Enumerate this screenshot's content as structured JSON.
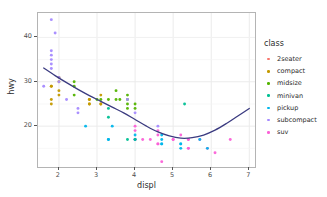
{
  "chart_data": {
    "type": "scatter",
    "title": "",
    "xlabel": "displ",
    "ylabel": "hwy",
    "xlim": [
      1.45,
      7.15
    ],
    "ylim": [
      10.8,
      45.5
    ],
    "xticks": [
      2,
      3,
      4,
      5,
      6,
      7
    ],
    "yticks": [
      20,
      30,
      40
    ],
    "xtick_labels": [
      "2",
      "3",
      "4",
      "5",
      "6",
      "7"
    ],
    "ytick_labels": [
      "20",
      "30",
      "40"
    ],
    "grid": true,
    "legend_position": "right",
    "legend_title": "class",
    "series": [
      {
        "name": "2seater",
        "color": "#F8766D",
        "points": [
          [
            5.7,
            26
          ],
          [
            5.7,
            23
          ],
          [
            6.2,
            26
          ],
          [
            6.2,
            25
          ],
          [
            7.0,
            24
          ]
        ]
      },
      {
        "name": "compact",
        "color": "#C49A00",
        "points": [
          [
            1.8,
            29
          ],
          [
            1.8,
            29
          ],
          [
            2.0,
            31
          ],
          [
            2.0,
            30
          ],
          [
            1.8,
            26
          ],
          [
            1.8,
            26
          ],
          [
            2.0,
            27
          ],
          [
            2.0,
            26
          ],
          [
            2.8,
            25
          ],
          [
            2.8,
            25
          ],
          [
            3.1,
            25
          ],
          [
            1.8,
            33
          ],
          [
            1.8,
            32
          ],
          [
            2.0,
            32
          ],
          [
            2.0,
            31
          ],
          [
            2.8,
            26
          ],
          [
            2.8,
            26
          ],
          [
            3.1,
            27
          ],
          [
            2.4,
            29
          ],
          [
            2.4,
            31
          ],
          [
            2.5,
            28
          ],
          [
            2.5,
            27
          ],
          [
            2.2,
            29
          ],
          [
            2.2,
            29
          ],
          [
            2.4,
            31
          ],
          [
            2.4,
            31
          ],
          [
            3.0,
            26
          ],
          [
            3.0,
            26
          ],
          [
            3.3,
            27
          ],
          [
            2.0,
            28
          ],
          [
            2.0,
            29
          ],
          [
            2.0,
            30
          ],
          [
            2.0,
            28
          ],
          [
            2.5,
            27
          ],
          [
            2.5,
            26
          ],
          [
            2.5,
            28
          ],
          [
            2.5,
            29
          ],
          [
            2.5,
            27
          ],
          [
            2.5,
            28
          ],
          [
            2.5,
            28
          ],
          [
            2.5,
            30
          ],
          [
            2.5,
            29
          ],
          [
            2.5,
            31
          ],
          [
            2.8,
            29
          ],
          [
            2.8,
            28
          ],
          [
            2.8,
            27
          ],
          [
            2.8,
            24
          ]
        ]
      },
      {
        "name": "midsize",
        "color": "#53B400",
        "points": [
          [
            2.4,
            29
          ],
          [
            2.4,
            29
          ],
          [
            3.1,
            26
          ],
          [
            3.5,
            28
          ],
          [
            2.4,
            27
          ],
          [
            3.0,
            26
          ],
          [
            3.5,
            28
          ],
          [
            3.6,
            26
          ],
          [
            2.4,
            30
          ],
          [
            3.0,
            26
          ],
          [
            3.3,
            26
          ],
          [
            3.8,
            27
          ],
          [
            3.8,
            26
          ],
          [
            2.4,
            31
          ],
          [
            3.0,
            27
          ],
          [
            3.5,
            28
          ],
          [
            2.5,
            28
          ],
          [
            2.5,
            29
          ],
          [
            3.0,
            27
          ],
          [
            3.3,
            25
          ],
          [
            3.5,
            29
          ],
          [
            3.6,
            26
          ],
          [
            3.8,
            25
          ],
          [
            2.4,
            30
          ],
          [
            3.0,
            26
          ],
          [
            3.1,
            25
          ],
          [
            3.5,
            26
          ],
          [
            3.8,
            23
          ],
          [
            2.0,
            29
          ],
          [
            2.5,
            26
          ],
          [
            3.5,
            27
          ],
          [
            3.8,
            26
          ],
          [
            3.0,
            27
          ],
          [
            2.4,
            31
          ],
          [
            4.0,
            25
          ],
          [
            4.2,
            23
          ],
          [
            3.3,
            24
          ],
          [
            3.8,
            24
          ],
          [
            2.5,
            26
          ],
          [
            3.5,
            25
          ],
          [
            3.5,
            26
          ]
        ]
      },
      {
        "name": "minivan",
        "color": "#00C094",
        "points": [
          [
            2.4,
            24
          ],
          [
            3.0,
            24
          ],
          [
            3.3,
            22
          ],
          [
            3.3,
            22
          ],
          [
            3.3,
            24
          ],
          [
            3.3,
            24
          ],
          [
            3.8,
            17
          ],
          [
            3.8,
            22
          ],
          [
            3.3,
            17
          ],
          [
            3.8,
            18
          ],
          [
            4.0,
            17
          ]
        ]
      },
      {
        "name": "pickup",
        "color": "#00B6EB"
      },
      {
        "name": "subcompact",
        "color": "#A58AFF"
      },
      {
        "name": "suv",
        "color": "#FB61D7"
      }
    ],
    "points": [
      {
        "x": 1.8,
        "y": 29,
        "c": "compact"
      },
      {
        "x": 1.8,
        "y": 29,
        "c": "compact"
      },
      {
        "x": 2.0,
        "y": 31,
        "c": "compact"
      },
      {
        "x": 2.0,
        "y": 30,
        "c": "compact"
      },
      {
        "x": 2.8,
        "y": 26,
        "c": "compact"
      },
      {
        "x": 2.8,
        "y": 26,
        "c": "compact"
      },
      {
        "x": 3.1,
        "y": 27,
        "c": "compact"
      },
      {
        "x": 1.8,
        "y": 26,
        "c": "compact"
      },
      {
        "x": 1.8,
        "y": 25,
        "c": "compact"
      },
      {
        "x": 2.0,
        "y": 28,
        "c": "compact"
      },
      {
        "x": 2.0,
        "y": 27,
        "c": "compact"
      },
      {
        "x": 2.8,
        "y": 25,
        "c": "compact"
      },
      {
        "x": 2.8,
        "y": 25,
        "c": "compact"
      },
      {
        "x": 3.1,
        "y": 25,
        "c": "compact"
      },
      {
        "x": 3.1,
        "y": 25,
        "c": "compact"
      },
      {
        "x": 2.4,
        "y": 29,
        "c": "midsize"
      },
      {
        "x": 2.4,
        "y": 27,
        "c": "midsize"
      },
      {
        "x": 3.1,
        "y": 26,
        "c": "midsize"
      },
      {
        "x": 3.5,
        "y": 26,
        "c": "midsize"
      },
      {
        "x": 3.6,
        "y": 26,
        "c": "midsize"
      },
      {
        "x": 2.4,
        "y": 30,
        "c": "midsize"
      },
      {
        "x": 3.0,
        "y": 26,
        "c": "midsize"
      },
      {
        "x": 3.3,
        "y": 26,
        "c": "midsize"
      },
      {
        "x": 3.8,
        "y": 27,
        "c": "midsize"
      },
      {
        "x": 3.8,
        "y": 26,
        "c": "midsize"
      },
      {
        "x": 4.0,
        "y": 25,
        "c": "midsize"
      },
      {
        "x": 3.5,
        "y": 28,
        "c": "midsize"
      },
      {
        "x": 3.8,
        "y": 25,
        "c": "midsize"
      },
      {
        "x": 3.8,
        "y": 24,
        "c": "midsize"
      },
      {
        "x": 4.0,
        "y": 24,
        "c": "midsize"
      },
      {
        "x": 4.6,
        "y": 19,
        "c": "suv"
      },
      {
        "x": 5.4,
        "y": 17,
        "c": "suv"
      },
      {
        "x": 5.4,
        "y": 15,
        "c": "suv"
      },
      {
        "x": 4.0,
        "y": 17,
        "c": "suv"
      },
      {
        "x": 4.0,
        "y": 17,
        "c": "suv"
      },
      {
        "x": 4.6,
        "y": 16,
        "c": "suv"
      },
      {
        "x": 5.0,
        "y": 17,
        "c": "suv"
      },
      {
        "x": 4.2,
        "y": 17,
        "c": "suv"
      },
      {
        "x": 4.4,
        "y": 17,
        "c": "suv"
      },
      {
        "x": 4.6,
        "y": 16,
        "c": "suv"
      },
      {
        "x": 5.4,
        "y": 15,
        "c": "suv"
      },
      {
        "x": 5.4,
        "y": 17,
        "c": "suv"
      },
      {
        "x": 4.0,
        "y": 19,
        "c": "suv"
      },
      {
        "x": 4.0,
        "y": 20,
        "c": "suv"
      },
      {
        "x": 4.6,
        "y": 18,
        "c": "suv"
      },
      {
        "x": 5.0,
        "y": 17,
        "c": "suv"
      },
      {
        "x": 4.7,
        "y": 12,
        "c": "suv"
      },
      {
        "x": 5.2,
        "y": 18,
        "c": "suv"
      },
      {
        "x": 5.7,
        "y": 17,
        "c": "suv"
      },
      {
        "x": 5.9,
        "y": 15,
        "c": "suv"
      },
      {
        "x": 6.5,
        "y": 17,
        "c": "suv"
      },
      {
        "x": 6.1,
        "y": 14,
        "c": "suv"
      },
      {
        "x": 3.3,
        "y": 17,
        "c": "pickup"
      },
      {
        "x": 3.3,
        "y": 17,
        "c": "pickup"
      },
      {
        "x": 4.0,
        "y": 17,
        "c": "pickup"
      },
      {
        "x": 4.7,
        "y": 16,
        "c": "pickup"
      },
      {
        "x": 4.7,
        "y": 16,
        "c": "pickup"
      },
      {
        "x": 5.2,
        "y": 15,
        "c": "pickup"
      },
      {
        "x": 5.2,
        "y": 16,
        "c": "pickup"
      },
      {
        "x": 5.7,
        "y": 17,
        "c": "pickup"
      },
      {
        "x": 5.9,
        "y": 15,
        "c": "pickup"
      },
      {
        "x": 2.7,
        "y": 20,
        "c": "pickup"
      },
      {
        "x": 3.4,
        "y": 20,
        "c": "pickup"
      },
      {
        "x": 4.0,
        "y": 18,
        "c": "pickup"
      },
      {
        "x": 4.7,
        "y": 18,
        "c": "pickup"
      },
      {
        "x": 4.7,
        "y": 17,
        "c": "pickup"
      },
      {
        "x": 5.2,
        "y": 16,
        "c": "pickup"
      },
      {
        "x": 1.8,
        "y": 44,
        "c": "subcompact"
      },
      {
        "x": 1.9,
        "y": 41,
        "c": "subcompact"
      },
      {
        "x": 1.8,
        "y": 37,
        "c": "subcompact"
      },
      {
        "x": 1.8,
        "y": 36,
        "c": "subcompact"
      },
      {
        "x": 1.8,
        "y": 35,
        "c": "subcompact"
      },
      {
        "x": 1.8,
        "y": 34,
        "c": "subcompact"
      },
      {
        "x": 1.8,
        "y": 33,
        "c": "subcompact"
      },
      {
        "x": 1.6,
        "y": 29,
        "c": "subcompact"
      },
      {
        "x": 2.0,
        "y": 31,
        "c": "subcompact"
      },
      {
        "x": 2.0,
        "y": 30,
        "c": "subcompact"
      },
      {
        "x": 2.2,
        "y": 26,
        "c": "subcompact"
      },
      {
        "x": 2.5,
        "y": 24,
        "c": "subcompact"
      },
      {
        "x": 2.5,
        "y": 23,
        "c": "subcompact"
      },
      {
        "x": 3.8,
        "y": 26,
        "c": "subcompact"
      },
      {
        "x": 4.0,
        "y": 23,
        "c": "subcompact"
      },
      {
        "x": 4.6,
        "y": 20,
        "c": "subcompact"
      },
      {
        "x": 5.3,
        "y": 25,
        "c": "minivan"
      },
      {
        "x": 3.3,
        "y": 22,
        "c": "minivan"
      },
      {
        "x": 3.3,
        "y": 24,
        "c": "minivan"
      },
      {
        "x": 3.8,
        "y": 17,
        "c": "minivan"
      },
      {
        "x": 4.0,
        "y": 17,
        "c": "minivan"
      }
    ],
    "smooth": {
      "name": "loess",
      "color": "#3B3B80",
      "linewidth": 1.3,
      "x": [
        1.6,
        1.9,
        2.2,
        2.5,
        2.8,
        3.1,
        3.4,
        3.7,
        4.0,
        4.3,
        4.6,
        4.9,
        5.2,
        5.5,
        5.8,
        6.1,
        6.4,
        6.7,
        7.0
      ],
      "y": [
        33.1,
        31.4,
        29.8,
        28.3,
        26.9,
        25.6,
        24.3,
        23.0,
        21.5,
        20.0,
        18.7,
        17.8,
        17.3,
        17.4,
        18.0,
        19.1,
        20.6,
        22.3,
        24.0
      ]
    }
  },
  "legend": {
    "title": "class",
    "items": [
      {
        "label": "2seater",
        "color": "#F8766D"
      },
      {
        "label": "compact",
        "color": "#C49A00"
      },
      {
        "label": "midsize",
        "color": "#53B400"
      },
      {
        "label": "minivan",
        "color": "#00C094"
      },
      {
        "label": "pickup",
        "color": "#00B6EB"
      },
      {
        "label": "subcompact",
        "color": "#A58AFF"
      },
      {
        "label": "suv",
        "color": "#FB61D7"
      }
    ]
  },
  "axes": {
    "x_title": "displ",
    "y_title": "hwy"
  }
}
